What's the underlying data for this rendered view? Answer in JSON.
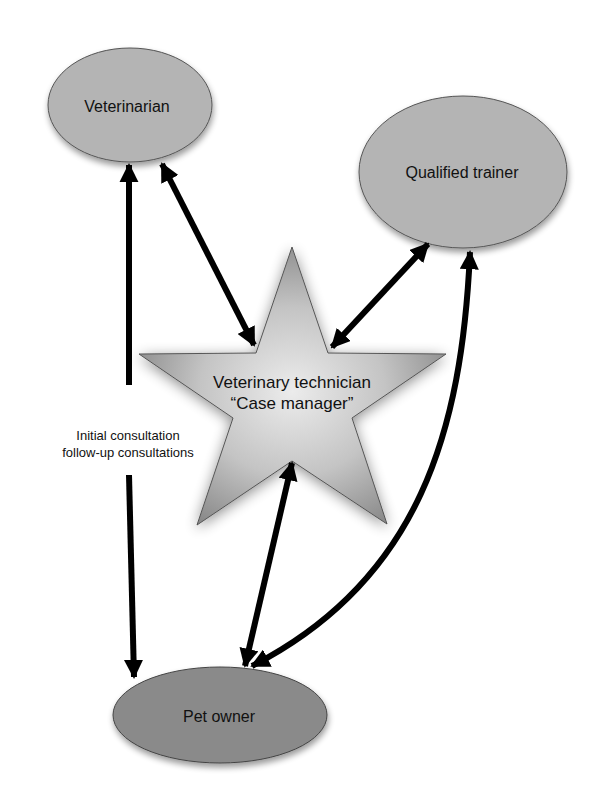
{
  "diagram": {
    "type": "relationship-diagram",
    "nodes": [
      {
        "id": "veterinarian",
        "label": "Veterinarian",
        "shape": "ellipse",
        "fill": "#b4b4b4"
      },
      {
        "id": "qualified_trainer",
        "label": "Qualified trainer",
        "shape": "ellipse",
        "fill": "#b4b4b4"
      },
      {
        "id": "vet_tech",
        "label_line1": "Veterinary technician",
        "label_line2": "“Case manager”",
        "shape": "star",
        "fill_center": "#e6e6e6",
        "fill_edge": "#8e8e8e"
      },
      {
        "id": "pet_owner",
        "label": "Pet owner",
        "shape": "ellipse",
        "fill": "#8a8a8a"
      }
    ],
    "edges": [
      {
        "from": "veterinarian",
        "to": "vet_tech",
        "direction": "bidirectional"
      },
      {
        "from": "qualified_trainer",
        "to": "vet_tech",
        "direction": "bidirectional"
      },
      {
        "from": "vet_tech",
        "to": "pet_owner",
        "direction": "bidirectional"
      },
      {
        "from": "veterinarian",
        "to": "pet_owner",
        "direction": "bidirectional",
        "label_line1": "Initial consultation",
        "label_line2": "follow-up consultations"
      },
      {
        "from": "qualified_trainer",
        "to": "pet_owner",
        "direction": "bidirectional",
        "curved": true
      }
    ],
    "edge_color": "#000000"
  }
}
